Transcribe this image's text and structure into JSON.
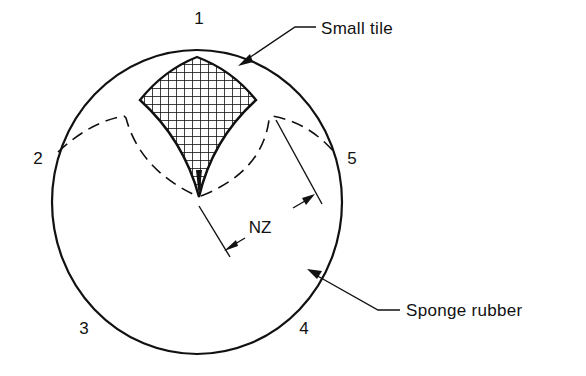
{
  "figure": {
    "colors": {
      "ink": "#111111",
      "background": "#ffffff"
    }
  },
  "labels": {
    "position_1": "1",
    "position_2": "2",
    "position_3": "3",
    "position_4": "4",
    "position_5": "5",
    "dimension": "NZ",
    "small_tile": "Small tile",
    "sponge_rubber": "Sponge rubber"
  }
}
